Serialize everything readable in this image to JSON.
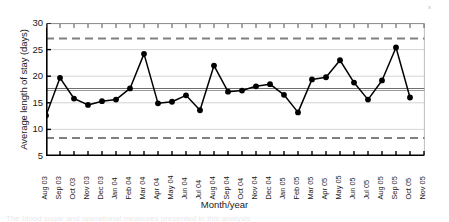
{
  "chart_data": {
    "type": "line",
    "title": "",
    "xlabel": "Month/year",
    "ylabel": "Average length of stay (days)",
    "ylim": [
      5,
      30
    ],
    "yticks": [
      5,
      10,
      15,
      20,
      25,
      30
    ],
    "grid": true,
    "legend": null,
    "categories": [
      "Aug 03",
      "Sep 03",
      "Oct 03",
      "Nov 03",
      "Dec 03",
      "Jan 04",
      "Feb 04",
      "Mar 04",
      "Apr 04",
      "May 04",
      "Jun 04",
      "Jul 04",
      "Aug 04",
      "Sep 04",
      "Oct 04",
      "Nov 04",
      "Dec 04",
      "Jan 05",
      "Feb 05",
      "Mar 05",
      "Apr 05",
      "May 05",
      "Jun 05",
      "Jul 05",
      "Aug 05",
      "Sep 05",
      "Oct 05",
      "Nov 05"
    ],
    "series": [
      {
        "name": "Average length of stay",
        "marker": "filled-circle",
        "values": [
          12.6,
          19.7,
          15.8,
          14.6,
          15.3,
          15.6,
          17.7,
          24.2,
          14.9,
          15.2,
          16.4,
          13.6,
          22.0,
          17.1,
          17.3,
          18.1,
          18.5,
          16.5,
          13.2,
          19.4,
          19.8,
          23.0,
          18.8,
          15.6,
          19.2,
          25.4,
          16.0,
          null
        ]
      }
    ],
    "reference_lines": [
      {
        "name": "upper-control-limit",
        "value": 27.1,
        "style": "dashed",
        "color": "#808080"
      },
      {
        "name": "lower-control-limit",
        "value": 8.4,
        "style": "dashed",
        "color": "#808080"
      },
      {
        "name": "center-line",
        "value": 17.7,
        "style": "solid",
        "color": "#6e6e6e"
      },
      {
        "name": "mean-line",
        "value": 17.3,
        "style": "solid",
        "color": "#9a9a9a"
      }
    ],
    "annotations": [
      {
        "name": "corner-mark",
        "text": "x"
      }
    ]
  },
  "axis": {
    "y": {
      "label": "Average length of stay (days)",
      "ticks": [
        "30",
        "25",
        "20",
        "15",
        "10",
        "5"
      ]
    },
    "x": {
      "label": "Month/year",
      "ticks": [
        "Aug 03",
        "Sep 03",
        "Oct 03",
        "Nov 03",
        "Dec 03",
        "Jan 04",
        "Feb 04",
        "Mar 04",
        "Apr 04",
        "May 04",
        "Jun 04",
        "Jul 04",
        "Aug 04",
        "Sep 04",
        "Oct 04",
        "Nov 04",
        "Dec 04",
        "Jan 05",
        "Feb 05",
        "Mar 05",
        "Apr 05",
        "May 05",
        "Jun 05",
        "Jul 05",
        "Aug 05",
        "Sep 05",
        "Oct 05",
        "Nov 05"
      ]
    }
  },
  "marks": {
    "corner_x": "x",
    "caption_fragment": "The blood sugar and operational measures presented in this analysis"
  },
  "colors": {
    "series": "#000000",
    "gridline": "#cfcfcf",
    "control_limit": "#7d7d7d",
    "center_line": "#6e6e6e",
    "axis": "#000000",
    "background": "#ffffff"
  }
}
